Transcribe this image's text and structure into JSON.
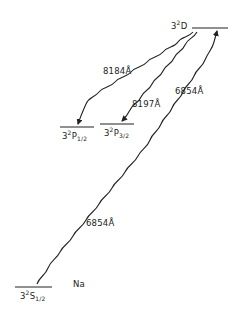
{
  "diagram": {
    "type": "energy-level-diagram",
    "element": "Na",
    "colors": {
      "ink": "#222222",
      "background": "#ffffff"
    },
    "levels": [
      {
        "id": "3D",
        "n": "3",
        "mult": "2",
        "term": "D",
        "j": ""
      },
      {
        "id": "3P12",
        "n": "3",
        "mult": "2",
        "term": "P",
        "j": "1/2"
      },
      {
        "id": "3P32",
        "n": "3",
        "mult": "2",
        "term": "P",
        "j": "3/2"
      },
      {
        "id": "3S12",
        "n": "3",
        "mult": "2",
        "term": "S",
        "j": "1/2"
      }
    ],
    "transitions": [
      {
        "from": "3D",
        "to": "3P12",
        "wavelength": "8184Å",
        "direction": "down"
      },
      {
        "from": "3D",
        "to": "3P32",
        "wavelength": "8197Å",
        "direction": "down"
      },
      {
        "from": "3S12",
        "to": "3D",
        "wavelength": "6854Å",
        "direction": "up"
      }
    ],
    "labels": {
      "element": "Na",
      "w8184": "8184Å",
      "w8197": "8197Å",
      "w6854_upper": "6854Å",
      "w6854_lower": "6854Å"
    }
  }
}
